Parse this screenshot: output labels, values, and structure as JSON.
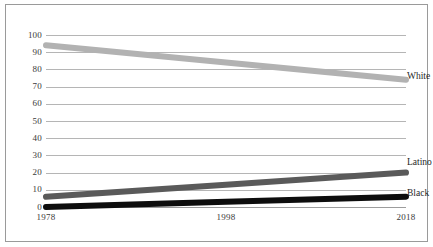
{
  "chart_data": {
    "type": "line",
    "title": "",
    "xlabel": "",
    "ylabel": "",
    "x": [
      1978,
      1998,
      2018
    ],
    "xtick_labels": [
      "1978",
      "1998",
      "2018"
    ],
    "ylim": [
      0,
      100
    ],
    "xlim": [
      1978,
      2018
    ],
    "ytick_labels": [
      "100",
      "90",
      "80",
      "70",
      "60",
      "50",
      "40",
      "30",
      "20",
      "10",
      "0"
    ],
    "ytick_values": [
      100,
      90,
      80,
      70,
      60,
      50,
      40,
      30,
      20,
      10,
      0
    ],
    "grid": "horizontal",
    "legend": "inline-right-labels",
    "series": [
      {
        "name": "White",
        "label": "White",
        "color": "#b2b2b2",
        "values": [
          94,
          84,
          74
        ]
      },
      {
        "name": "Latino",
        "label": "Latino",
        "color": "#5a5a5a",
        "values": [
          6,
          13,
          20
        ]
      },
      {
        "name": "Black",
        "label": "Black",
        "color": "#0d0d0d",
        "values": [
          0,
          3,
          6
        ]
      }
    ]
  },
  "axis": {
    "y_ticks": [
      {
        "label": "100"
      },
      {
        "label": "90"
      },
      {
        "label": "80"
      },
      {
        "label": "70"
      },
      {
        "label": "60"
      },
      {
        "label": "50"
      },
      {
        "label": "40"
      },
      {
        "label": "30"
      },
      {
        "label": "20"
      },
      {
        "label": "10"
      },
      {
        "label": "0"
      }
    ],
    "x_ticks": [
      {
        "label": "1978"
      },
      {
        "label": "1998"
      },
      {
        "label": "2018"
      }
    ]
  },
  "series_labels": {
    "white": "White",
    "latino": "Latino",
    "black": "Black"
  },
  "colors": {
    "white_series": "#b2b2b2",
    "latino_series": "#5a5a5a",
    "black_series": "#0d0d0d",
    "gridline": "#b5b5b5",
    "frame": "#9a9a9a",
    "tick_text": "#3a3a3a"
  }
}
